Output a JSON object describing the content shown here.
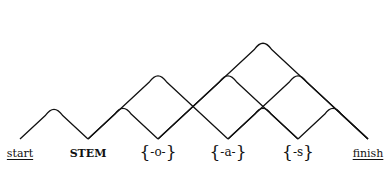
{
  "diagram": {
    "type": "finite-state word lattice",
    "baseline_y": 139,
    "nodes": [
      {
        "id": "start",
        "label": "start",
        "x": 20,
        "style": "underline"
      },
      {
        "id": "stem",
        "label": "STEM",
        "x": 88,
        "style": "bold"
      },
      {
        "id": "o",
        "label": "-o-",
        "x": 158,
        "style": "braced"
      },
      {
        "id": "a",
        "label": "-a-",
        "x": 228,
        "style": "braced"
      },
      {
        "id": "s",
        "label": "-s",
        "x": 298,
        "style": "braced"
      },
      {
        "id": "finish",
        "label": "finish",
        "x": 368,
        "style": "underline"
      }
    ],
    "arcs": [
      {
        "from": "start",
        "to": "stem",
        "size": "small"
      },
      {
        "from": "stem",
        "to": "o",
        "size": "small"
      },
      {
        "from": "stem",
        "to": "a",
        "size": "medium"
      },
      {
        "from": "o",
        "to": "s",
        "size": "medium"
      },
      {
        "from": "o",
        "to": "finish",
        "size": "large"
      },
      {
        "from": "a",
        "to": "s",
        "size": "small"
      },
      {
        "from": "a",
        "to": "finish",
        "size": "medium"
      },
      {
        "from": "s",
        "to": "finish",
        "size": "small"
      }
    ],
    "brace_open": "{",
    "brace_close": "}"
  }
}
